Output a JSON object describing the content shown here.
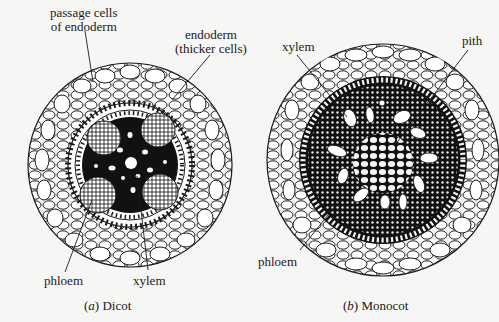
{
  "figures": [
    {
      "id": "a",
      "caption_letter": "a",
      "caption_text": "Dicot",
      "labels": {
        "passage_cells_line1": "passage cells",
        "passage_cells_line2": "of endoderm",
        "endoderm_line1": "endoderm",
        "endoderm_line2": "(thicker cells)",
        "phloem": "phloem",
        "xylem": "xylem"
      }
    },
    {
      "id": "b",
      "caption_letter": "b",
      "caption_text": "Monocot",
      "labels": {
        "xylem": "xylem",
        "pith": "pith",
        "phloem": "phloem"
      }
    }
  ],
  "colors": {
    "ink": "#1a1a1a",
    "paper": "#f6f6f4",
    "stele": "#111111"
  }
}
